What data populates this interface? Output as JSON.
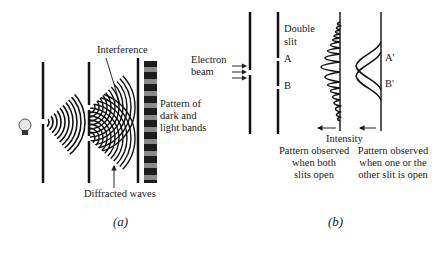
{
  "panel_a": {
    "caption": "(a)",
    "labels": {
      "interference": "Interference",
      "pattern_line1": "Pattern of",
      "pattern_line2": "dark and",
      "pattern_line3": "light bands",
      "diffracted": "Diffracted waves"
    },
    "icons": [
      "light-bulb-icon"
    ],
    "band_colors": {
      "dark": "#1c1c1c",
      "light": "#8a8a8a"
    }
  },
  "panel_b": {
    "caption": "(b)",
    "labels": {
      "electron_line1": "Electron",
      "electron_line2": "beam",
      "double_line1": "Double",
      "double_line2": "slit",
      "slit_a": "A",
      "slit_b": "B",
      "peak_a": "A'",
      "peak_b": "B'",
      "intensity": "Intensity",
      "both_line1": "Pattern observed",
      "both_line2": "when both",
      "both_line3": "slits open",
      "one_line1": "Pattern observed",
      "one_line2": "when one or the",
      "one_line3": "other slit is open"
    }
  }
}
